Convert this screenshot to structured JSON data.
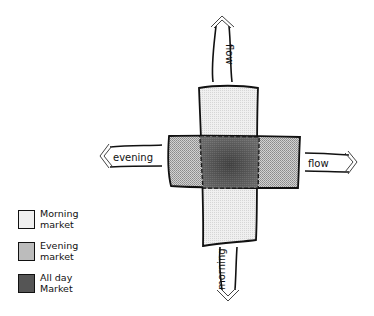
{
  "diagram": {
    "arrows": [
      {
        "id": "top",
        "label": "flow",
        "direction": "up"
      },
      {
        "id": "left",
        "label": "evening",
        "direction": "left"
      },
      {
        "id": "right",
        "label": "flow",
        "direction": "right"
      },
      {
        "id": "bottom",
        "label": "morning",
        "direction": "down"
      }
    ],
    "blocks": [
      {
        "id": "vertical",
        "market": "Morning market",
        "color": "#ececec"
      },
      {
        "id": "horizontal",
        "market": "Evening market",
        "color": "#b9b9b9"
      },
      {
        "id": "center",
        "market": "All day Market",
        "color": "#5a5a5a"
      }
    ]
  },
  "legend": {
    "items": [
      {
        "line1": "Morning",
        "line2": "market",
        "color": "#ececec"
      },
      {
        "line1": "Evening",
        "line2": "market",
        "color": "#b9b9b9"
      },
      {
        "line1": "All day",
        "line2": "Market",
        "color": "#5a5a5a"
      }
    ]
  }
}
